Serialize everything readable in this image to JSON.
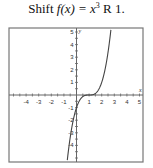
{
  "title": {
    "prefix": "Shift ",
    "func": "f(x) = x",
    "exp": "3",
    "suffix": " R 1."
  },
  "chart_data": {
    "type": "line",
    "function": "(x-1)^3",
    "xlabel": "x",
    "ylabel": "y",
    "xlim": [
      -5.3,
      5.3
    ],
    "ylim": [
      -5.3,
      5.3
    ],
    "x_ticks": [
      -4,
      -3,
      -2,
      -1,
      1,
      2,
      3,
      4,
      5
    ],
    "y_ticks": [
      -4,
      -3,
      -2,
      -1,
      1,
      2,
      3,
      4,
      5
    ],
    "x_tick_labels": [
      "-4",
      "-3",
      "-2",
      "-1",
      "1",
      "2",
      "3",
      "4",
      "5"
    ],
    "y_tick_labels": [
      "-4",
      "-3",
      "-2",
      "-1",
      "1",
      "2",
      "3",
      "4",
      "5"
    ],
    "grid": false,
    "series": [
      {
        "name": "y = (x-1)^3",
        "x": [
          -0.74,
          -0.5,
          0,
          0.5,
          1,
          1.5,
          2,
          2.5,
          2.74
        ],
        "y": [
          -5.3,
          -3.375,
          -1,
          -0.125,
          0,
          0.125,
          1,
          3.375,
          5.3
        ]
      }
    ]
  }
}
